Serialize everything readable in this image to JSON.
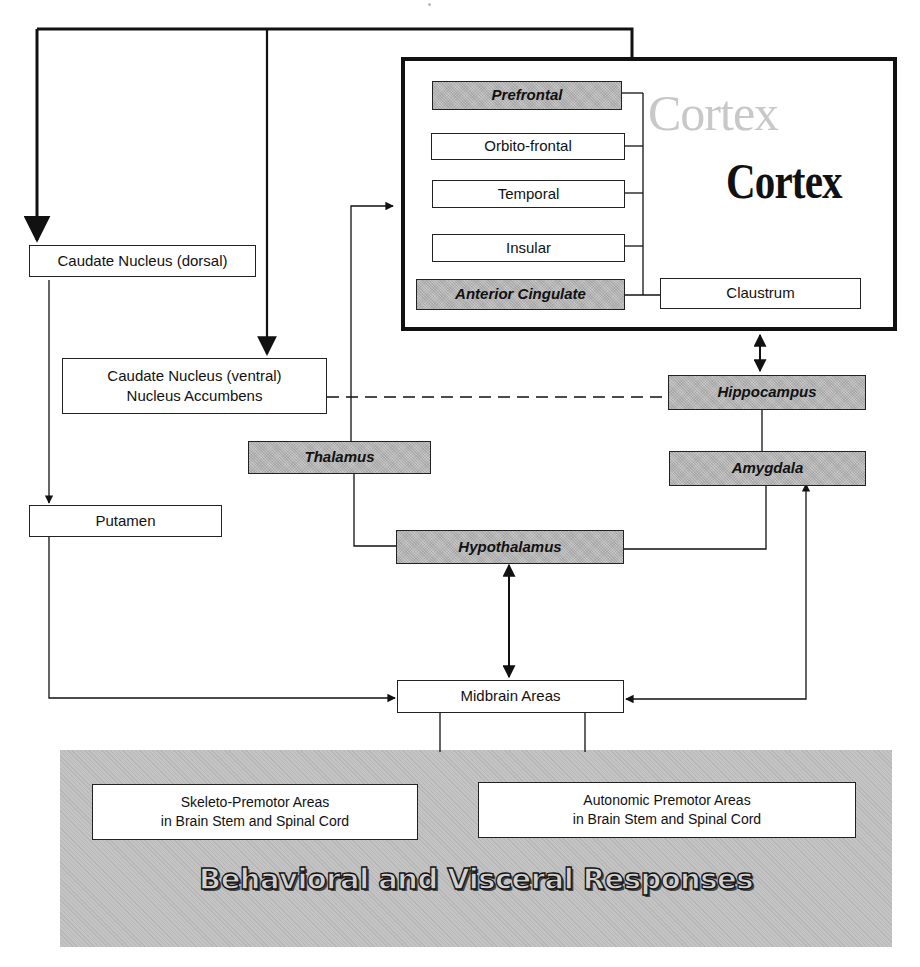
{
  "diagram": {
    "cortex": {
      "title_ghost": "Cortex",
      "title": "Cortex",
      "regions": [
        {
          "label": "Prefrontal",
          "shaded": true
        },
        {
          "label": "Orbito-frontal",
          "shaded": false
        },
        {
          "label": "Temporal",
          "shaded": false
        },
        {
          "label": "Insular",
          "shaded": false
        },
        {
          "label": "Anterior Cingulate",
          "shaded": true
        }
      ],
      "claustrum": "Claustrum"
    },
    "nodes": {
      "caudate_dorsal": "Caudate Nucleus (dorsal)",
      "caudate_ventral_line1": "Caudate Nucleus (ventral)",
      "caudate_ventral_line2": "Nucleus Accumbens",
      "putamen": "Putamen",
      "thalamus": "Thalamus",
      "hippocampus": "Hippocampus",
      "amygdala": "Amygdala",
      "hypothalamus": "Hypothalamus",
      "midbrain": "Midbrain Areas"
    },
    "outputs": {
      "skeleto_line1": "Skeleto-Premotor Areas",
      "skeleto_line2": "in Brain Stem and Spinal Cord",
      "autonomic_line1": "Autonomic Premotor Areas",
      "autonomic_line2": "in Brain Stem and Spinal Cord",
      "responses_title": "Behavioral and Visceral Responses"
    },
    "colors": {
      "line": "#111111",
      "shaded_fill": "#b9b9b9",
      "panel_fill": "#c4c4c4",
      "ghost_text": "#c8c8c8"
    }
  }
}
